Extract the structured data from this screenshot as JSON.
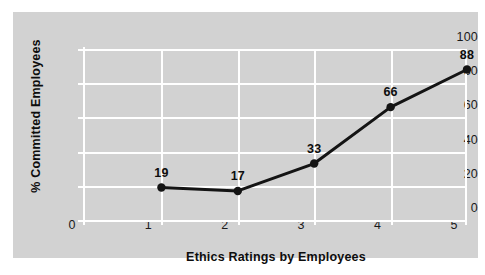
{
  "chart_data": {
    "type": "line",
    "title": "",
    "xlabel": "Ethics Ratings by Employees",
    "ylabel": "% Committed Employees",
    "categories": [
      1,
      2,
      3,
      4,
      5
    ],
    "x": [
      1,
      2,
      3,
      4,
      5
    ],
    "values": [
      19,
      17,
      33,
      66,
      88
    ],
    "point_labels": [
      "19",
      "17",
      "33",
      "66",
      "88"
    ],
    "xlim": [
      0,
      5
    ],
    "ylim": [
      0,
      100
    ],
    "xticks": [
      "0",
      "1",
      "2",
      "3",
      "4",
      "5"
    ],
    "yticks": [
      "0",
      "20",
      "40",
      "60",
      "80",
      "100"
    ],
    "grid": true,
    "legend": "none",
    "series": [
      {
        "name": "% Committed Employees",
        "values": [
          19,
          17,
          33,
          66,
          88
        ]
      }
    ],
    "colors": {
      "panel_background": "#d2d2d2",
      "figure_background": "#ffffff",
      "gridline": "#ffffff",
      "line": "#141414",
      "marker": "#141414",
      "text": "#0d0d0d"
    }
  }
}
